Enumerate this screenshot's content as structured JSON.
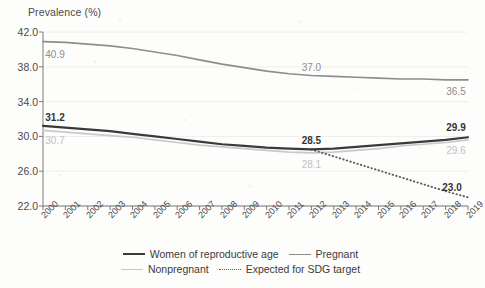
{
  "axis": {
    "y_title": "Prevalence (%)",
    "y_ticks": [
      "42.0",
      "38.0",
      "34.0",
      "30.0",
      "26.0",
      "22.0"
    ],
    "x_ticks": [
      "2000",
      "2001",
      "2002",
      "2003",
      "2004",
      "2005",
      "2006",
      "2007",
      "2008",
      "2009",
      "2010",
      "2011",
      "2012",
      "2013",
      "2014",
      "2015",
      "2016",
      "2017",
      "2018",
      "2019"
    ]
  },
  "legend": {
    "row1": [
      {
        "label": "Women of reproductive age",
        "style": "solid-dark"
      },
      {
        "label": "Pregnant",
        "style": "solid-mid"
      }
    ],
    "row2": [
      {
        "label": "Nonpregnant",
        "style": "solid-light"
      },
      {
        "label": "Expected for SDG target",
        "style": "dotted"
      }
    ]
  },
  "annotations": [
    {
      "text": "40.9",
      "x": 2000,
      "value": 40.9,
      "tone": "mid",
      "dx": 12,
      "dy": 12
    },
    {
      "text": "37.0",
      "x": 2012,
      "value": 37.0,
      "tone": "mid",
      "dx": 0,
      "dy": -9
    },
    {
      "text": "36.5",
      "x": 2019,
      "value": 36.5,
      "tone": "mid",
      "dx": -12,
      "dy": 11
    },
    {
      "text": "31.2",
      "x": 2000,
      "value": 31.2,
      "tone": "dark",
      "dx": 12,
      "dy": -9
    },
    {
      "text": "30.7",
      "x": 2000,
      "value": 30.7,
      "tone": "light",
      "dx": 12,
      "dy": 10
    },
    {
      "text": "28.5",
      "x": 2012,
      "value": 28.5,
      "tone": "dark",
      "dx": 0,
      "dy": -9
    },
    {
      "text": "28.1",
      "x": 2012,
      "value": 28.1,
      "tone": "light",
      "dx": 0,
      "dy": 11
    },
    {
      "text": "29.9",
      "x": 2019,
      "value": 29.9,
      "tone": "dark",
      "dx": -12,
      "dy": -10
    },
    {
      "text": "29.6",
      "x": 2019,
      "value": 29.6,
      "tone": "light",
      "dx": -12,
      "dy": 10
    },
    {
      "text": "23.0",
      "x": 2019,
      "value": 23.0,
      "tone": "dark",
      "dx": -16,
      "dy": -10
    }
  ],
  "colors": {
    "women": "#3a3a3a",
    "pregnant": "#8d8d8d",
    "nonpregnant": "#c9c9c9",
    "sdg": "#5a5a5a",
    "grid": "#eeeeec",
    "axis": "#7a7a7a",
    "background": "#fdfdfc"
  },
  "chart_data": {
    "type": "line",
    "title": "",
    "xlabel": "",
    "ylabel": "Prevalence (%)",
    "xlim": [
      2000,
      2019
    ],
    "ylim": [
      22.0,
      42.0
    ],
    "yticks": [
      22.0,
      26.0,
      30.0,
      34.0,
      38.0,
      42.0
    ],
    "grid": "horizontal-faint",
    "legend_position": "bottom",
    "x": [
      2000,
      2001,
      2002,
      2003,
      2004,
      2005,
      2006,
      2007,
      2008,
      2009,
      2010,
      2011,
      2012,
      2013,
      2014,
      2015,
      2016,
      2017,
      2018,
      2019
    ],
    "series": [
      {
        "name": "Women of reproductive age",
        "style": "solid",
        "color": "#3a3a3a",
        "values": [
          31.2,
          31.0,
          30.8,
          30.6,
          30.3,
          30.0,
          29.7,
          29.4,
          29.1,
          28.9,
          28.7,
          28.6,
          28.5,
          28.6,
          28.8,
          29.0,
          29.2,
          29.4,
          29.6,
          29.9
        ]
      },
      {
        "name": "Pregnant",
        "style": "solid",
        "color": "#8d8d8d",
        "values": [
          40.9,
          40.8,
          40.6,
          40.4,
          40.1,
          39.7,
          39.3,
          38.8,
          38.3,
          37.9,
          37.5,
          37.2,
          37.0,
          36.9,
          36.8,
          36.7,
          36.6,
          36.6,
          36.5,
          36.5
        ]
      },
      {
        "name": "Nonpregnant",
        "style": "solid",
        "color": "#c9c9c9",
        "values": [
          30.7,
          30.5,
          30.3,
          30.1,
          29.9,
          29.6,
          29.3,
          29.0,
          28.8,
          28.6,
          28.4,
          28.2,
          28.1,
          28.2,
          28.4,
          28.6,
          28.9,
          29.1,
          29.3,
          29.6
        ]
      },
      {
        "name": "Expected for SDG target",
        "style": "dotted",
        "color": "#5a5a5a",
        "x": [
          2012,
          2013,
          2014,
          2015,
          2016,
          2017,
          2018,
          2019
        ],
        "values": [
          28.5,
          27.7,
          26.9,
          26.1,
          25.3,
          24.5,
          23.7,
          23.0
        ]
      }
    ]
  }
}
